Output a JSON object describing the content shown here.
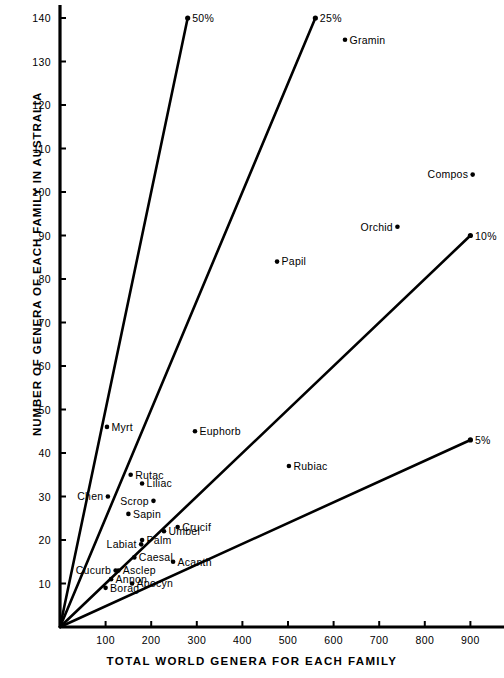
{
  "chart_data": {
    "type": "scatter",
    "title": "",
    "xlabel": "TOTAL WORLD GENERA FOR EACH FAMILY",
    "ylabel": "NUMBER OF GENERA OF EACH FAMILY IN AUSTRALIA",
    "xlim": [
      0,
      960
    ],
    "ylim": [
      0,
      143
    ],
    "xticks": [
      100,
      200,
      300,
      400,
      500,
      600,
      700,
      800,
      900
    ],
    "yticks": [
      10,
      20,
      30,
      40,
      50,
      60,
      70,
      80,
      90,
      100,
      110,
      120,
      130,
      140
    ],
    "xtick_labels": [
      "100",
      "200",
      "300",
      "400",
      "500",
      "600",
      "700",
      "800",
      "900"
    ],
    "ytick_labels": [
      "10",
      "20",
      "30",
      "40",
      "50",
      "60",
      "70",
      "80",
      "90",
      "100",
      "110",
      "120",
      "130",
      "140"
    ],
    "grid": false,
    "legend": "none",
    "points": [
      {
        "label": "Gramin",
        "x": 625,
        "y": 135,
        "label_side": "right"
      },
      {
        "label": "Compos",
        "x": 905,
        "y": 104,
        "label_side": "left"
      },
      {
        "label": "Orchid",
        "x": 740,
        "y": 92,
        "label_side": "left"
      },
      {
        "label": "Papil",
        "x": 476,
        "y": 84,
        "label_side": "right"
      },
      {
        "label": "Euphorb",
        "x": 296,
        "y": 45,
        "label_side": "right"
      },
      {
        "label": "Myrt",
        "x": 103,
        "y": 46,
        "label_side": "right"
      },
      {
        "label": "Rubiac",
        "x": 502,
        "y": 37,
        "label_side": "right"
      },
      {
        "label": "Rutac",
        "x": 155,
        "y": 35,
        "label_side": "right"
      },
      {
        "label": "Liliac",
        "x": 180,
        "y": 33,
        "label_side": "right"
      },
      {
        "label": "Chen",
        "x": 105,
        "y": 30,
        "label_side": "left"
      },
      {
        "label": "Scrop",
        "x": 205,
        "y": 29,
        "label_side": "left"
      },
      {
        "label": "Sapin",
        "x": 150,
        "y": 26,
        "label_side": "right"
      },
      {
        "label": "Crucif",
        "x": 258,
        "y": 23,
        "label_side": "right"
      },
      {
        "label": "Umbel",
        "x": 228,
        "y": 22,
        "label_side": "right"
      },
      {
        "label": "Palm",
        "x": 180,
        "y": 20,
        "label_side": "right"
      },
      {
        "label": "Labiat",
        "x": 178,
        "y": 19,
        "label_side": "left"
      },
      {
        "label": "Caesal",
        "x": 163,
        "y": 16,
        "label_side": "right"
      },
      {
        "label": "Acanth",
        "x": 248,
        "y": 15,
        "label_side": "right"
      },
      {
        "label": "Cucurb",
        "x": 122,
        "y": 13,
        "label_side": "left"
      },
      {
        "label": "Asclep",
        "x": 128,
        "y": 13,
        "label_side": "right"
      },
      {
        "label": "Annon",
        "x": 112,
        "y": 11,
        "label_side": "right"
      },
      {
        "label": "Apocyn",
        "x": 158,
        "y": 10,
        "label_side": "right"
      },
      {
        "label": "Borag",
        "x": 100,
        "y": 9,
        "label_side": "right"
      }
    ],
    "ratio_lines": [
      {
        "label": "50%",
        "percent": 50,
        "end_x": 280,
        "end_y": 140
      },
      {
        "label": "25%",
        "percent": 25,
        "end_x": 560,
        "end_y": 140
      },
      {
        "label": "10%",
        "percent": 10,
        "end_x": 900,
        "end_y": 90
      },
      {
        "label": "5%",
        "percent": 5,
        "end_x": 900,
        "end_y": 43
      }
    ]
  },
  "axes": {
    "x_title": "TOTAL WORLD GENERA FOR EACH FAMILY",
    "y_title": "NUMBER OF GENERA OF EACH FAMILY IN AUSTRALIA"
  },
  "colors": {
    "ink": "#000000",
    "background": "#ffffff"
  }
}
